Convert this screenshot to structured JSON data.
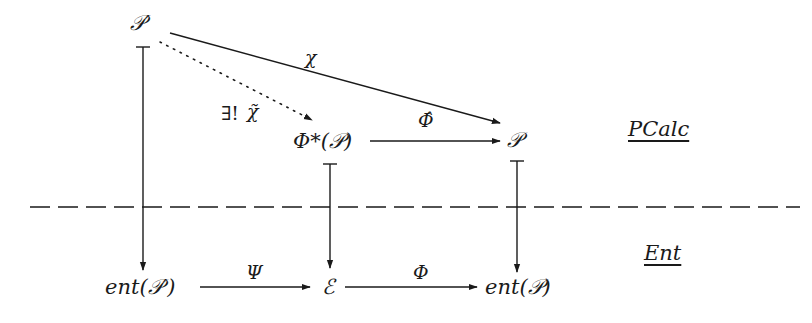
{
  "diagram": {
    "nodes": {
      "p_prime": "𝒫′",
      "phi_star_p": "Φ*(𝒫)",
      "p": "𝒫",
      "ent_p_prime": "ent(𝒫′)",
      "e": "ℰ",
      "ent_p": "ent(𝒫)"
    },
    "edges": {
      "chi": "χ",
      "chi_tilde_prefix": "∃!",
      "chi_tilde": "χ̃",
      "phi_hat": "Φ̂",
      "psi": "Ψ",
      "phi": "Φ"
    },
    "layers": {
      "top": "PCalc",
      "bottom": "Ent"
    },
    "colors": {
      "ink": "#1a1a1a",
      "background": "#ffffff"
    }
  }
}
